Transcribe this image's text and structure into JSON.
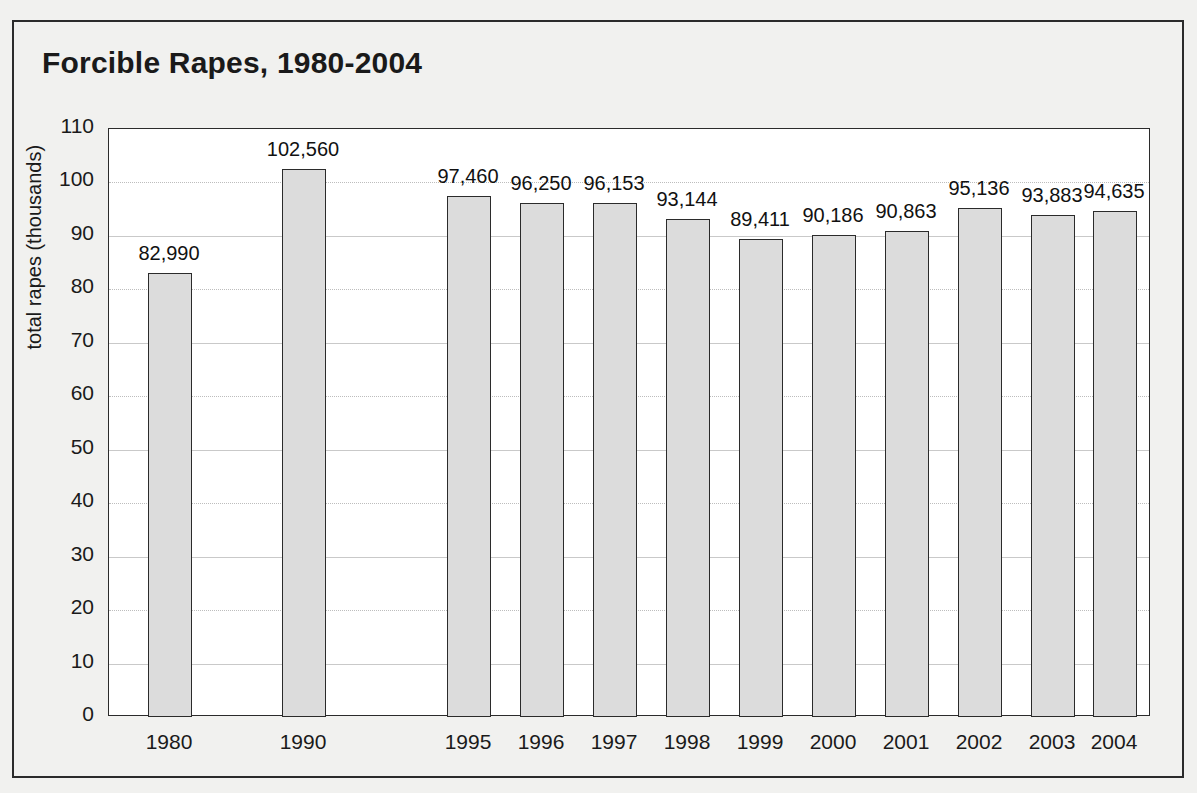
{
  "figure": {
    "title": "Forcible Rapes, 1980-2004",
    "background_color": "#f1f1ef",
    "frame_color": "#2b2b2b",
    "plot_background": "#ffffff",
    "bar_fill": "#dcdcdc",
    "bar_border": "#2b2b2b",
    "gridline_color": "#c9c9c9"
  },
  "chart_data": {
    "type": "bar",
    "title": "Forcible Rapes, 1980-2004",
    "xlabel": "",
    "ylabel": "total rapes (thousands)",
    "categories": [
      "1980",
      "1990",
      "1995",
      "1996",
      "1997",
      "1998",
      "1999",
      "2000",
      "2001",
      "2002",
      "2003",
      "2004"
    ],
    "values": [
      82.99,
      102.56,
      97.46,
      96.25,
      96.153,
      93.144,
      89.411,
      90.186,
      90.863,
      95.136,
      93.883,
      94.635
    ],
    "value_labels": [
      "82,990",
      "102,560",
      "97,460",
      "96,250",
      "96,153",
      "93,144",
      "89,411",
      "90,186",
      "90,863",
      "95,136",
      "93,883",
      "94,635"
    ],
    "ylim": [
      0,
      110
    ],
    "ytick_labels": [
      "110",
      "100",
      "90",
      "80",
      "70",
      "60",
      "50",
      "40",
      "30",
      "20",
      "10",
      "0"
    ],
    "ytick_values": [
      110,
      100,
      90,
      80,
      70,
      60,
      50,
      40,
      30,
      20,
      10,
      0
    ],
    "grid": true,
    "legend": "none",
    "units": "thousands"
  }
}
